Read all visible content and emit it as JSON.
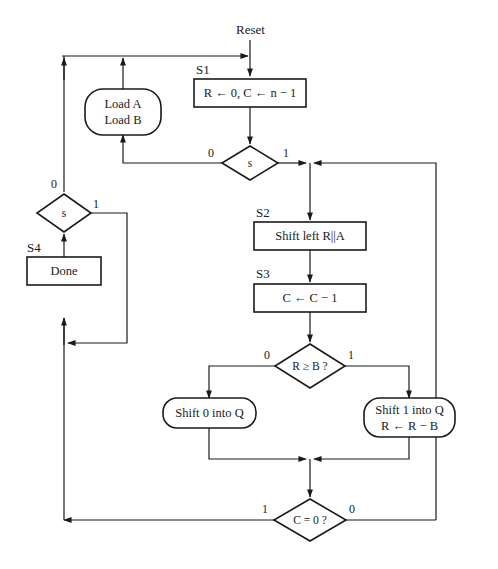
{
  "diagram": {
    "type": "flowchart (ASM chart)",
    "entry": {
      "label": "Reset"
    },
    "states": [
      {
        "id": "S1",
        "tag": "S1",
        "action": "R ← 0, C ← n − 1"
      },
      {
        "id": "S2",
        "tag": "S2",
        "action": "Shift left R||A"
      },
      {
        "id": "S3",
        "tag": "S3",
        "action": "C ← C − 1"
      },
      {
        "id": "S4",
        "tag": "S4",
        "action": "Done"
      }
    ],
    "conditional_outputs": [
      {
        "id": "load",
        "lines": [
          "Load A",
          "Load B"
        ]
      },
      {
        "id": "shift0",
        "lines": [
          "Shift 0 into Q"
        ]
      },
      {
        "id": "shift1",
        "lines": [
          "Shift 1 into Q",
          "R ← R − B"
        ]
      }
    ],
    "decisions": [
      {
        "id": "s_top",
        "text": "s",
        "false_label": "0",
        "true_label": "1"
      },
      {
        "id": "s_left",
        "text": "s",
        "false_label": "0",
        "true_label": "1"
      },
      {
        "id": "r_ge_b",
        "text": "R ≥ B ?",
        "false_label": "0",
        "true_label": "1"
      },
      {
        "id": "c_eq_0",
        "text": "C = 0 ?",
        "true_label": "1",
        "false_label": "0"
      }
    ],
    "colors": {
      "stroke": "#1a1a1a",
      "background": "#ffffff"
    }
  }
}
